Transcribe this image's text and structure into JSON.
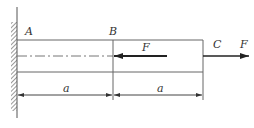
{
  "diagram": {
    "type": "cantilever-bar-axial-loads",
    "points": {
      "A": "A",
      "B": "B",
      "C": "C"
    },
    "forces": [
      {
        "label": "F",
        "location": "B",
        "direction": "left"
      },
      {
        "label": "F",
        "location": "C",
        "direction": "right"
      }
    ],
    "dimensions": [
      {
        "label": "a",
        "from": "A",
        "to": "B"
      },
      {
        "label": "a",
        "from": "B",
        "to": "C"
      }
    ],
    "support": "fixed-wall-left",
    "colors": {
      "line": "#555555",
      "arrow": "#222222",
      "text": "#333333"
    }
  }
}
